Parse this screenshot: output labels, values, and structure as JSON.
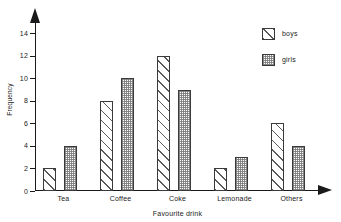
{
  "chart_data": {
    "type": "bar",
    "title": "",
    "subtitle": "",
    "xlabel": "Favourite drink",
    "ylabel": "Frequency",
    "categories": [
      "Tea",
      "Coffee",
      "Coke",
      "Lemonade",
      "Others"
    ],
    "series": [
      {
        "name": "boys",
        "values": [
          2,
          8,
          12,
          2,
          6
        ],
        "pattern": "diagonal-hatch"
      },
      {
        "name": "girls",
        "values": [
          4,
          10,
          9,
          3,
          4
        ],
        "pattern": "dotted-stipple"
      }
    ],
    "ylim": [
      0,
      15
    ],
    "yticks": [
      0,
      2,
      4,
      6,
      8,
      10,
      12,
      14
    ],
    "ytick_labels": [
      "0",
      "2",
      "4",
      "6",
      "8",
      "10",
      "12",
      "14"
    ],
    "grid": false,
    "legend_position": "top-right",
    "axis_arrows": {
      "y": "up",
      "x": "right"
    },
    "colors": {
      "axis": "#1a1a1a",
      "bar_outline": "#3a3a3a",
      "hatch": "#5a5a5a",
      "stipple": "#787878",
      "background": "#ffffff"
    }
  },
  "legend": {
    "items": [
      {
        "label": "boys"
      },
      {
        "label": "girls"
      }
    ]
  }
}
